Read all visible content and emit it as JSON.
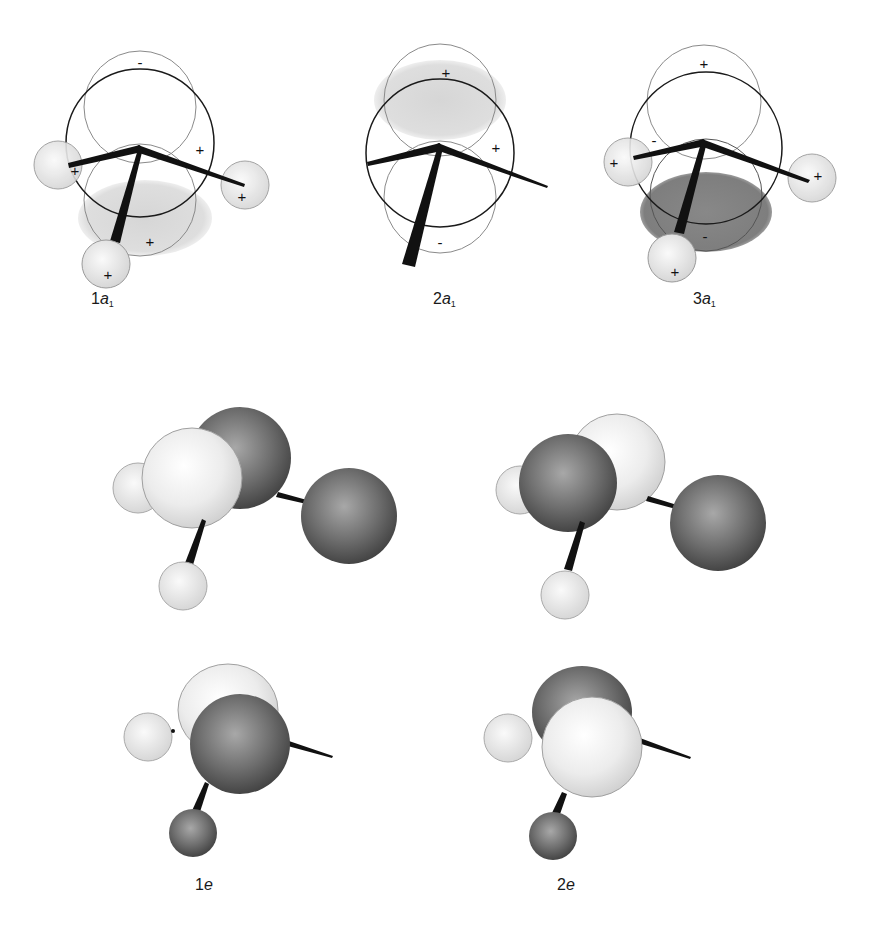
{
  "figure": {
    "panels": [
      {
        "id": "1a1",
        "label_num": "1",
        "label_sym": "a",
        "label_sub": "1",
        "signs": [
          "-",
          "+",
          "+",
          "+",
          "+"
        ]
      },
      {
        "id": "2a1",
        "label_num": "2",
        "label_sym": "a",
        "label_sub": "1",
        "signs": [
          "+",
          "+",
          "-"
        ]
      },
      {
        "id": "3a1",
        "label_num": "3",
        "label_sym": "a",
        "label_sub": "1",
        "signs": [
          "+",
          "-",
          "+",
          "+",
          "-",
          "+"
        ]
      },
      {
        "id": "1e",
        "label_num": "1",
        "label_sym": "e",
        "label_sub": ""
      },
      {
        "id": "2e",
        "label_num": "2",
        "label_sym": "e",
        "label_sub": ""
      }
    ],
    "colors": {
      "positive_lobe": "#dcdcdc",
      "negative_lobe": "#7a7a7a",
      "light_sphere": "#efefef",
      "dark_sphere": "#6c6c6c",
      "outline": "#1a1a1a",
      "thin_outline": "#8a8a8a"
    }
  }
}
